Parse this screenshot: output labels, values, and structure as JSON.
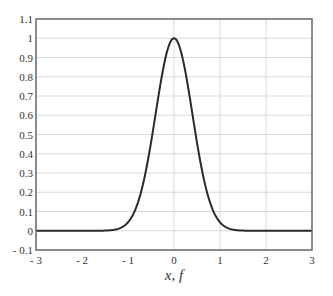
{
  "chart_data": {
    "type": "line",
    "title": "",
    "xlabel": "x, f",
    "ylabel": "",
    "xlim": [
      -3,
      3
    ],
    "ylim": [
      -0.1,
      1.1
    ],
    "xticks": [
      -3,
      -2,
      -1,
      0,
      1,
      2,
      3
    ],
    "xtick_labels": [
      "- 3",
      "- 2",
      "- 1",
      "0",
      "1",
      "2",
      "3"
    ],
    "yticks": [
      -0.1,
      0,
      0.1,
      0.2,
      0.3,
      0.4,
      0.5,
      0.6,
      0.7,
      0.8,
      0.9,
      1,
      1.1
    ],
    "ytick_labels": [
      "- 0.1",
      "0",
      "0.1",
      "0.2",
      "0.3",
      "0.4",
      "0.5",
      "0.6",
      "0.7",
      "0.8",
      "0.9",
      "1",
      "1.1"
    ],
    "grid": {
      "horizontal": true,
      "vertical_at": [
        0,
        1,
        2
      ]
    },
    "legend": null,
    "series": [
      {
        "name": "f(x)",
        "description": "Gaussian-like pulse centered at 0, peak 1, sigma ~0.4",
        "x": [
          -3,
          -2,
          -1.5,
          -1.2,
          -1,
          -0.8,
          -0.6,
          -0.4,
          -0.2,
          0,
          0.2,
          0.4,
          0.6,
          0.8,
          1,
          1.2,
          1.5,
          2,
          3
        ],
        "values": [
          0,
          0,
          0.001,
          0.011,
          0.044,
          0.135,
          0.325,
          0.607,
          0.882,
          1,
          0.882,
          0.607,
          0.325,
          0.135,
          0.044,
          0.011,
          0.001,
          0,
          0
        ],
        "color": "#2a2a2a"
      }
    ],
    "colors": {
      "curve": "#2a2a2a",
      "grid": "#d9d9d9",
      "frame": "#666666"
    }
  }
}
